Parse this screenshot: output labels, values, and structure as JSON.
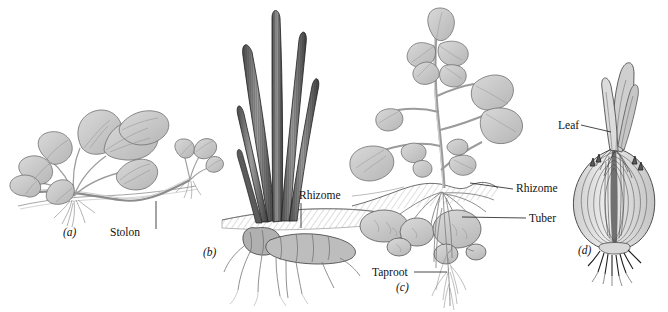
{
  "figure": {
    "kind": "botanical-line-illustration",
    "background_color": "#ffffff",
    "ink_color": "#1a1a1a",
    "fill_light": "#d5d5d5",
    "fill_mid": "#b8b8b8",
    "fill_dark": "#6e6e6e",
    "fill_blade": "#8a8a8a",
    "width": 668,
    "height": 312
  },
  "panels": [
    {
      "id": "(a)",
      "subject": "strawberry-plant-with-runner",
      "id_x": 63,
      "id_y": 236,
      "labels": [
        {
          "text": "Stolon",
          "x": 110,
          "y": 236,
          "anchor": "start",
          "leader": "M 156 229 L 156 201"
        }
      ]
    },
    {
      "id": "(b)",
      "subject": "iris-plant-with-rhizome",
      "id_x": 203,
      "id_y": 256,
      "labels": [
        {
          "text": "Rhizome",
          "x": 299,
          "y": 199,
          "anchor": "start",
          "leader": "M 301 203 L 301 228"
        }
      ]
    },
    {
      "id": "(c)",
      "subject": "potato-plant-with-tubers",
      "id_x": 396,
      "id_y": 291,
      "labels": [
        {
          "text": "Rhizome",
          "x": 516,
          "y": 192,
          "anchor": "start",
          "leader": "M 513 189 L 470 183"
        },
        {
          "text": "Tuber",
          "x": 529,
          "y": 222,
          "anchor": "start",
          "leader": "M 526 218 L 462 217"
        },
        {
          "text": "Taproot",
          "x": 372,
          "y": 276,
          "anchor": "start",
          "leader": "M 414 272 L 447 272"
        }
      ]
    },
    {
      "id": "(d)",
      "subject": "onion-bulb",
      "id_x": 578,
      "id_y": 254,
      "labels": [
        {
          "text": "Leaf",
          "x": 558,
          "y": 129,
          "anchor": "start",
          "leader": "M 581 125 L 611 132"
        }
      ]
    }
  ]
}
